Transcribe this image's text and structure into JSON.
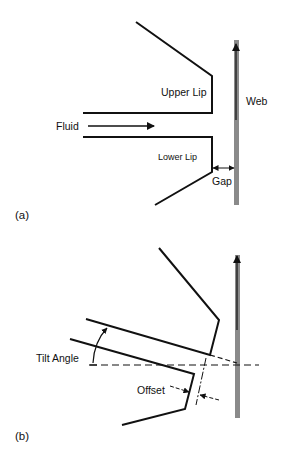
{
  "figure": {
    "panel_a": {
      "label": "(a)",
      "labels": {
        "upper_lip": "Upper Lip",
        "lower_lip": "Lower Lip",
        "fluid": "Fluid",
        "web": "Web",
        "gap": "Gap"
      }
    },
    "panel_b": {
      "label": "(b)",
      "labels": {
        "tilt_angle": "Tilt Angle",
        "offset": "Offset"
      }
    },
    "colors": {
      "line": "#111111",
      "web": "#8a8a8a",
      "background": "#ffffff"
    }
  }
}
